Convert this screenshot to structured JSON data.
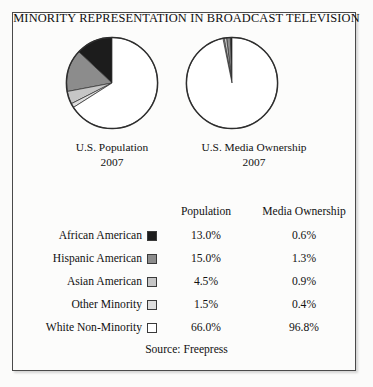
{
  "figure": {
    "title": "MINORITY REPRESENTATION IN BROADCAST TELEVISION",
    "source": "Source: Freepress",
    "border_color": "#4a4a4a",
    "background": "#fcfcfb"
  },
  "pies": [
    {
      "name": "pie-population",
      "caption": "U.S. Population",
      "year": "2007"
    },
    {
      "name": "pie-media",
      "caption": "U.S. Media Ownership",
      "year": "2007"
    }
  ],
  "table": {
    "headers": {
      "label": "",
      "swatch": "",
      "col1": "Population",
      "col2": "Media Ownership"
    },
    "rows": [
      {
        "label": "African American",
        "color": "#1c1c1c",
        "population": "13.0%",
        "media_ownership": "0.6%"
      },
      {
        "label": "Hispanic American",
        "color": "#8c8c8c",
        "population": "15.0%",
        "media_ownership": "1.3%"
      },
      {
        "label": "Asian American",
        "color": "#c6c6c6",
        "population": "4.5%",
        "media_ownership": "0.9%"
      },
      {
        "label": "Other Minority",
        "color": "#dedede",
        "population": "1.5%",
        "media_ownership": "0.4%"
      },
      {
        "label": "White Non-Minority",
        "color": "#ffffff",
        "population": "66.0%",
        "media_ownership": "96.8%"
      }
    ]
  },
  "chart_data": {
    "type": "pie",
    "title": "MINORITY REPRESENTATION IN BROADCAST TELEVISION",
    "source": "Source: Freepress",
    "categories": [
      "African American",
      "Hispanic American",
      "Asian American",
      "Other Minority",
      "White Non-Minority"
    ],
    "colors": [
      "#1c1c1c",
      "#8c8c8c",
      "#c6c6c6",
      "#dedede",
      "#ffffff"
    ],
    "charts": [
      {
        "name": "U.S. Population",
        "subtitle": "2007",
        "unit": "%",
        "values": [
          13.0,
          15.0,
          4.5,
          1.5,
          66.0
        ],
        "start_angle_deg": 0,
        "direction": "counterclockwise"
      },
      {
        "name": "U.S. Media Ownership",
        "subtitle": "2007",
        "unit": "%",
        "values": [
          0.6,
          1.3,
          0.9,
          0.4,
          96.8
        ],
        "start_angle_deg": 0,
        "direction": "counterclockwise"
      }
    ],
    "legend_position": "table-below",
    "grid": false
  }
}
